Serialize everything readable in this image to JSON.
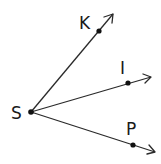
{
  "diagram": {
    "type": "rays-from-common-endpoint",
    "vertex": {
      "label": "S",
      "x": 31,
      "y": 112,
      "label_x": 11,
      "label_y": 119
    },
    "rays": [
      {
        "name": "ray-SK",
        "point_label": "K",
        "point": {
          "x": 99,
          "y": 31
        },
        "tip": {
          "x": 113,
          "y": 14
        },
        "label_x": 79,
        "label_y": 29
      },
      {
        "name": "ray-SI",
        "point_label": "I",
        "point": {
          "x": 128,
          "y": 83
        },
        "tip": {
          "x": 151,
          "y": 77
        },
        "label_x": 120,
        "label_y": 74
      },
      {
        "name": "ray-SP",
        "point_label": "P",
        "point": {
          "x": 133,
          "y": 145
        },
        "tip": {
          "x": 155,
          "y": 152
        },
        "label_x": 126,
        "label_y": 135
      }
    ],
    "colors": {
      "line": "#2a2a2a",
      "point": "#111111",
      "text": "#1a1a1a",
      "background": "#ffffff"
    }
  }
}
